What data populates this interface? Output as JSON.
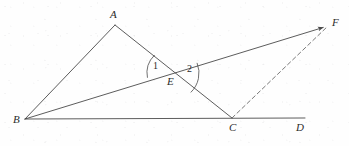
{
  "figure": {
    "kind": "geometry-diagram",
    "canvas": {
      "width": 349,
      "height": 146
    },
    "stroke_color": "#4a4a4a",
    "dashed_stroke_color": "#6a6a6a",
    "label_color": "#2b2b2b",
    "background_color": "#fefefe",
    "points": [
      {
        "id": "A",
        "label": "A",
        "x": 115,
        "y": 25,
        "label_x": 110,
        "label_y": 9
      },
      {
        "id": "B",
        "label": "B",
        "x": 25,
        "y": 119,
        "label_x": 13,
        "label_y": 114
      },
      {
        "id": "C",
        "label": "C",
        "x": 232,
        "y": 118,
        "label_x": 229,
        "label_y": 122
      },
      {
        "id": "D",
        "label": "D",
        "x": 305,
        "y": 118,
        "label_x": 296,
        "label_y": 122
      },
      {
        "id": "E",
        "label": "E",
        "x": 172,
        "y": 73,
        "label_x": 167,
        "label_y": 76
      },
      {
        "id": "F",
        "label": "F",
        "x": 328,
        "y": 26,
        "label_x": 332,
        "label_y": 17
      }
    ],
    "segments": [
      {
        "id": "BA",
        "from": "B",
        "to": "A",
        "style": "solid",
        "arrow": false
      },
      {
        "id": "AC",
        "from": "A",
        "to": "C",
        "style": "solid",
        "arrow": false
      },
      {
        "id": "BF",
        "from": "B",
        "to": "F",
        "style": "solid",
        "arrow": true
      },
      {
        "id": "BD",
        "from": "B",
        "to": "D",
        "style": "solid",
        "arrow": false
      },
      {
        "id": "CF",
        "from": "C",
        "to": "F",
        "style": "dashed",
        "arrow": false
      }
    ],
    "angle_marks": [
      {
        "id": "angle-1",
        "label": "1",
        "vertex": "E",
        "radius": 25,
        "start_deg": 169,
        "end_deg": 226,
        "label_x": 153,
        "label_y": 61
      },
      {
        "id": "angle-2",
        "label": "2",
        "vertex": "E",
        "radius": 27,
        "start_deg": -22,
        "end_deg": 46,
        "label_x": 187,
        "label_y": 64
      }
    ]
  }
}
